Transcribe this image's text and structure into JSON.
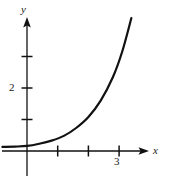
{
  "figure": {
    "kind": "math-graph",
    "width": 172,
    "height": 179,
    "background_color": "#ffffff",
    "stroke_color": "#111111"
  },
  "axes": {
    "x_axis_label": "x",
    "y_axis_label": "y",
    "x_tick_labels": [
      "3"
    ],
    "y_tick_labels": [
      "2"
    ],
    "origin_px": {
      "x": 27,
      "y": 151
    },
    "unit_px": {
      "x": 30.7,
      "y": 31.5
    },
    "x_tick_values": [
      1,
      2,
      3
    ],
    "y_tick_values": [
      1,
      2,
      3
    ],
    "arrowheads": [
      "x-positive",
      "y-positive"
    ]
  },
  "chart_data": {
    "type": "line",
    "title": "",
    "xlabel": "x",
    "ylabel": "y",
    "xlim": [
      -0.8,
      4.6
    ],
    "ylim": [
      -0.6,
      4.9
    ],
    "grid": false,
    "legend": null,
    "xticks": [
      1,
      2,
      3
    ],
    "xtick_labels": [
      "",
      "",
      "3"
    ],
    "yticks": [
      1,
      2,
      3
    ],
    "ytick_labels": [
      "",
      "2",
      ""
    ],
    "series": [
      {
        "name": "exponential curve",
        "x": [
          -0.8,
          -0.4,
          0.0,
          0.4,
          0.8,
          1.2,
          1.6,
          2.0,
          2.4,
          2.8,
          3.1,
          3.4
        ],
        "y": [
          0.13,
          0.14,
          0.16,
          0.23,
          0.33,
          0.48,
          0.73,
          1.08,
          1.6,
          2.35,
          3.15,
          4.22
        ],
        "stroke_color": "#111111",
        "stroke_width_px": 2.2
      }
    ]
  }
}
